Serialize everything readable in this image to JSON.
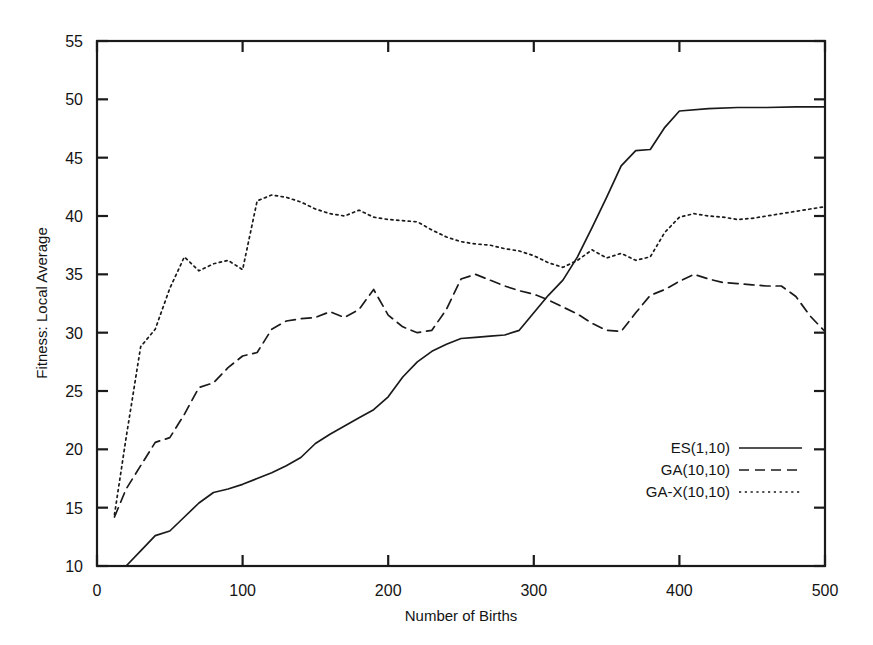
{
  "chart_data": {
    "type": "line",
    "title": "",
    "xlabel": "Number of Births",
    "ylabel": "Fitness: Local Average",
    "xlim": [
      0,
      500
    ],
    "ylim": [
      10,
      55
    ],
    "xticks": [
      0,
      100,
      200,
      300,
      400,
      500
    ],
    "yticks": [
      10,
      15,
      20,
      25,
      30,
      35,
      40,
      45,
      50,
      55
    ],
    "grid": false,
    "legend_position": "center-right",
    "series": [
      {
        "name": "ES(1,10)",
        "style": "solid",
        "color": "#1a1a1a",
        "x": [
          20,
          30,
          40,
          50,
          60,
          70,
          80,
          90,
          100,
          110,
          120,
          130,
          140,
          150,
          160,
          170,
          180,
          190,
          200,
          210,
          220,
          230,
          240,
          250,
          260,
          270,
          280,
          290,
          300,
          310,
          320,
          330,
          340,
          350,
          360,
          370,
          380,
          390,
          400,
          420,
          440,
          460,
          480,
          500
        ],
        "y": [
          10.0,
          11.3,
          12.6,
          13.0,
          14.2,
          15.4,
          16.3,
          16.6,
          17.0,
          17.5,
          18.0,
          18.6,
          19.3,
          20.5,
          21.3,
          22.0,
          22.7,
          23.4,
          24.5,
          26.2,
          27.5,
          28.4,
          29.0,
          29.5,
          29.6,
          29.7,
          29.8,
          30.2,
          31.7,
          33.2,
          34.5,
          36.5,
          39.0,
          41.6,
          44.3,
          45.6,
          45.7,
          47.6,
          49.0,
          49.2,
          49.3,
          49.3,
          49.35,
          49.35
        ]
      },
      {
        "name": "GA(10,10)",
        "style": "dashed",
        "color": "#1a1a1a",
        "x": [
          12,
          20,
          30,
          40,
          50,
          60,
          70,
          80,
          90,
          100,
          110,
          120,
          130,
          140,
          150,
          160,
          170,
          180,
          190,
          200,
          210,
          220,
          230,
          240,
          250,
          260,
          270,
          280,
          290,
          300,
          310,
          320,
          330,
          340,
          350,
          360,
          370,
          380,
          390,
          400,
          410,
          420,
          430,
          440,
          450,
          460,
          470,
          480,
          490,
          500
        ],
        "y": [
          14.2,
          16.6,
          18.6,
          20.6,
          21.0,
          23.0,
          25.3,
          25.7,
          27.0,
          28.0,
          28.3,
          30.3,
          31.0,
          31.2,
          31.3,
          31.8,
          31.3,
          32.0,
          33.7,
          31.5,
          30.5,
          30.0,
          30.2,
          32.0,
          34.6,
          35.0,
          34.5,
          34.0,
          33.6,
          33.3,
          32.8,
          32.2,
          31.6,
          30.8,
          30.2,
          30.1,
          31.7,
          33.2,
          33.7,
          34.4,
          35.0,
          34.6,
          34.3,
          34.2,
          34.1,
          34.0,
          34.0,
          33.1,
          31.4,
          30.1
        ]
      },
      {
        "name": "GA-X(10,10)",
        "style": "dotted",
        "color": "#1a1a1a",
        "x": [
          12,
          20,
          30,
          40,
          50,
          60,
          70,
          80,
          90,
          100,
          110,
          120,
          130,
          140,
          150,
          160,
          170,
          180,
          190,
          200,
          210,
          220,
          230,
          240,
          250,
          260,
          270,
          280,
          290,
          300,
          310,
          320,
          330,
          340,
          350,
          360,
          370,
          380,
          390,
          400,
          410,
          420,
          430,
          440,
          450,
          460,
          470,
          480,
          490,
          500
        ],
        "y": [
          14.4,
          21.0,
          28.8,
          30.3,
          33.8,
          36.5,
          35.3,
          35.9,
          36.2,
          35.4,
          41.3,
          41.8,
          41.6,
          41.2,
          40.6,
          40.2,
          40.0,
          40.5,
          39.9,
          39.7,
          39.6,
          39.5,
          38.8,
          38.2,
          37.8,
          37.6,
          37.5,
          37.2,
          37.0,
          36.6,
          36.0,
          35.6,
          36.2,
          37.1,
          36.4,
          36.8,
          36.2,
          36.5,
          38.6,
          39.9,
          40.2,
          40.0,
          39.9,
          39.7,
          39.8,
          40.0,
          40.2,
          40.4,
          40.6,
          40.8
        ]
      }
    ]
  },
  "legend": {
    "entries": [
      {
        "label": "ES(1,10)",
        "style": "solid"
      },
      {
        "label": "GA(10,10)",
        "style": "dashed"
      },
      {
        "label": "GA-X(10,10)",
        "style": "dotted"
      }
    ]
  }
}
